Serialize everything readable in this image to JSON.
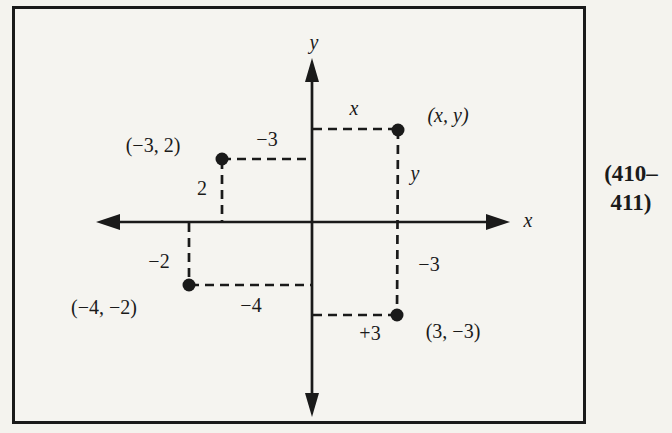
{
  "figure": {
    "page_ref": {
      "line1": "(410–",
      "line2": "411)"
    },
    "axes": {
      "x_label": "x",
      "y_label": "y"
    },
    "points": [
      {
        "name": "generic-point",
        "label": "(x, y)",
        "x_dist_label": "x",
        "y_dist_label": "y"
      },
      {
        "name": "point-neg3-2",
        "label": "(−3, 2)",
        "x_dist_label": "−3",
        "y_dist_label": "2"
      },
      {
        "name": "point-neg4-neg2",
        "label": "(−4, −2)",
        "x_dist_label": "−4",
        "y_dist_label": "−2"
      },
      {
        "name": "point-3-neg3",
        "label": "(3, −3)",
        "x_dist_label": "+3",
        "y_dist_label": "−3"
      }
    ],
    "colors": {
      "ink": "#1a1a1a",
      "background": "#f4f3ee"
    }
  }
}
